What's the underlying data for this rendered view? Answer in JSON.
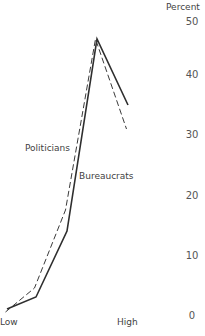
{
  "chart_data": {
    "type": "line",
    "title": "",
    "xlabel": "",
    "ylabel": "Percent",
    "x_axis_labels": {
      "left": "Low",
      "right": "High"
    },
    "categories": [
      "1 (Low)",
      "2",
      "3",
      "4",
      "5 (High)"
    ],
    "ylim": [
      0,
      50
    ],
    "yticks": [
      0,
      10,
      20,
      30,
      40,
      50
    ],
    "grid": false,
    "legend_position": "inline labels",
    "series": [
      {
        "name": "Politicians",
        "style": "dashed",
        "values": [
          0.5,
          4.5,
          17.5,
          46,
          31
        ]
      },
      {
        "name": "Bureaucrats",
        "style": "solid",
        "values": [
          1,
          3,
          14,
          46,
          35
        ]
      }
    ]
  },
  "labels": {
    "y_axis_title": "Percent",
    "x_low": "Low",
    "x_high": "High",
    "series_politicians": "Politicians",
    "series_bureaucrats": "Bureaucrats",
    "ticks": [
      "50",
      "40",
      "30",
      "20",
      "10",
      "0"
    ]
  },
  "colors": {
    "line": "#333333",
    "text": "#3f3f3f"
  }
}
